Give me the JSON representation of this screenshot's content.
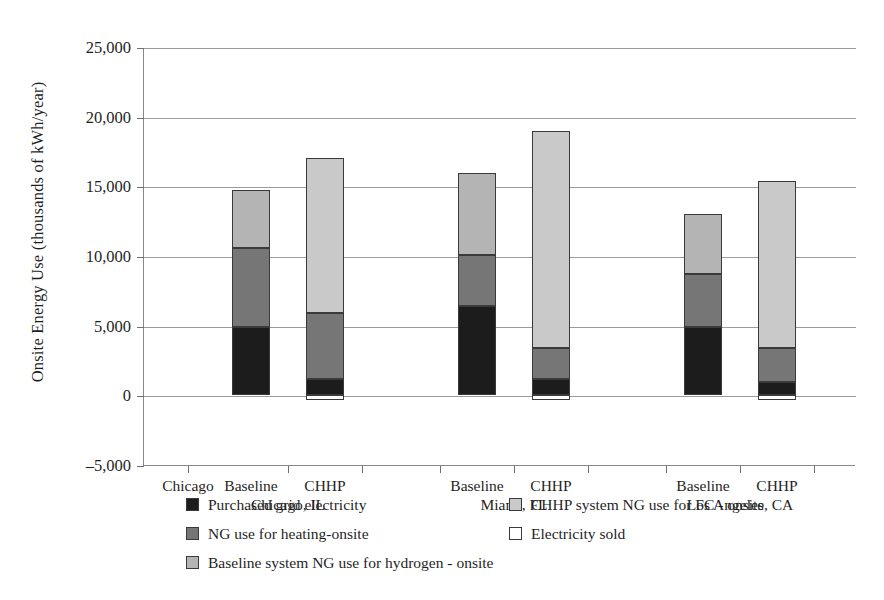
{
  "chart_data": {
    "type": "bar",
    "subtype": "stacked",
    "title": "",
    "xlabel": "",
    "ylabel": "Onsite Energy Use (thousands of kWh/year)",
    "ylim": [
      -5000,
      25000
    ],
    "ytick_labels": [
      "25,000",
      "20,000",
      "15,000",
      "10,000",
      "5,000",
      "0",
      "–5,000"
    ],
    "ytick_values": [
      25000,
      20000,
      15000,
      10000,
      5000,
      0,
      -5000
    ],
    "grid": true,
    "legend_position": "bottom",
    "x_axis_note": "Chicago",
    "categories": [
      "Baseline Chicago, IL",
      "CHHP",
      "Baseline Miami, FL",
      "CHHP",
      "Baseline Los Angeles, CA",
      "CHHP"
    ],
    "series": [
      {
        "name": "Purchased grid electricity",
        "color": "#1c1c1c",
        "values": [
          4900,
          1200,
          6400,
          1200,
          4900,
          950
        ]
      },
      {
        "name": "NG use for heating-onsite",
        "color": "#767676",
        "values": [
          5700,
          4700,
          3700,
          2200,
          3800,
          2450
        ]
      },
      {
        "name": "Baseline system NG use for hydrogen - onsite",
        "color": "#b4b4b4",
        "values": [
          4150,
          0,
          5850,
          0,
          4300,
          0
        ]
      },
      {
        "name": "CHHP system NG use for FC - onsite",
        "color": "#c9c9c9",
        "values": [
          0,
          11100,
          0,
          15600,
          0,
          11950
        ]
      },
      {
        "name": "Electricity sold",
        "color": "#ffffff",
        "values": [
          0,
          -350,
          0,
          -350,
          0,
          -350
        ]
      }
    ],
    "totals": [
      14750,
      17000,
      15950,
      19000,
      13000,
      15350
    ]
  },
  "axis_labels": {
    "origin_note": "Chicago",
    "groups": [
      {
        "line1": "Baseline",
        "line2": "Chicago, IL"
      },
      {
        "line1": "CHHP",
        "line2": ""
      },
      {
        "line1": "Baseline",
        "line2": "Miami, FL"
      },
      {
        "line1": "CHHP",
        "line2": ""
      },
      {
        "line1": "Baseline",
        "line2": "Los Angeles, CA"
      },
      {
        "line1": "CHHP",
        "line2": ""
      }
    ]
  },
  "legend": {
    "left_column": [
      {
        "label": "Purchased grid electricity",
        "color": "#1c1c1c"
      },
      {
        "label": "NG use for heating-onsite",
        "color": "#767676"
      },
      {
        "label": "Baseline system NG use for hydrogen - onsite",
        "color": "#b4b4b4"
      }
    ],
    "right_column": [
      {
        "label": "CHHP system NG use for FC - onsite",
        "color": "#c9c9c9"
      },
      {
        "label": "Electricity sold",
        "color": "#ffffff"
      }
    ]
  }
}
